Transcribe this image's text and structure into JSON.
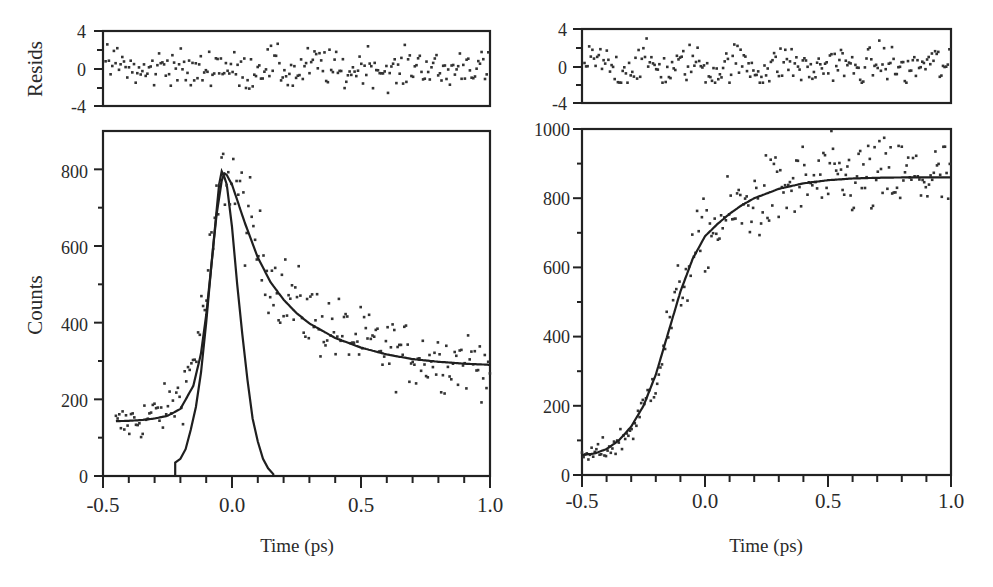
{
  "chart_data": [
    {
      "id": "left",
      "type": "scatter",
      "title": "",
      "panels": {
        "residuals": {
          "ylabel": "Resids",
          "ylim": [
            -4,
            4
          ],
          "yticks": [
            "4",
            "0",
            "-4"
          ],
          "ytick_values": [
            4,
            0,
            -4
          ],
          "minor_yticks": [
            2,
            -2
          ]
        },
        "main": {
          "ylabel": "Counts",
          "xlabel": "Time (ps)",
          "xlim": [
            -0.5,
            1.0
          ],
          "ylim": [
            0,
            900
          ],
          "xticks": [
            "-0.5",
            "0.0",
            "0.5",
            "1.0"
          ],
          "xtick_values": [
            -0.5,
            0.0,
            0.5,
            1.0
          ],
          "yticks": [
            "0",
            "200",
            "400",
            "600",
            "800"
          ],
          "ytick_values": [
            0,
            200,
            400,
            600,
            800
          ],
          "minor_ytick_values": [
            100,
            300,
            500,
            700
          ],
          "grid": false,
          "legend": null
        }
      },
      "series": [
        {
          "name": "data (scatter points)",
          "style": "dots",
          "x": [
            -0.45,
            -0.4,
            -0.35,
            -0.3,
            -0.25,
            -0.2,
            -0.15,
            -0.1,
            -0.07,
            -0.05,
            -0.03,
            -0.02,
            0.0,
            0.02,
            0.05,
            0.1,
            0.15,
            0.2,
            0.25,
            0.3,
            0.35,
            0.4,
            0.45,
            0.5,
            0.6,
            0.7,
            0.8,
            0.9,
            1.0
          ],
          "y": [
            130,
            140,
            148,
            160,
            175,
            210,
            300,
            470,
            620,
            730,
            790,
            810,
            780,
            740,
            680,
            590,
            525,
            480,
            445,
            420,
            400,
            380,
            365,
            350,
            330,
            315,
            305,
            300,
            295
          ]
        },
        {
          "name": "fit",
          "style": "line",
          "x": [
            -0.45,
            -0.4,
            -0.35,
            -0.3,
            -0.25,
            -0.2,
            -0.15,
            -0.12,
            -0.1,
            -0.08,
            -0.06,
            -0.04,
            -0.03,
            -0.02,
            0.0,
            0.02,
            0.05,
            0.1,
            0.15,
            0.2,
            0.25,
            0.3,
            0.4,
            0.5,
            0.6,
            0.7,
            0.8,
            0.9,
            1.0
          ],
          "y": [
            143,
            144,
            146,
            150,
            157,
            175,
            235,
            320,
            420,
            550,
            680,
            770,
            790,
            785,
            760,
            720,
            660,
            570,
            505,
            460,
            425,
            398,
            360,
            335,
            317,
            305,
            298,
            293,
            290
          ]
        },
        {
          "name": "instrument response",
          "style": "stepped line",
          "x": [
            -0.5,
            -0.22,
            -0.22,
            -0.2,
            -0.18,
            -0.16,
            -0.14,
            -0.12,
            -0.1,
            -0.08,
            -0.06,
            -0.05,
            -0.04,
            -0.03,
            -0.02,
            0.0,
            0.02,
            0.04,
            0.06,
            0.08,
            0.1,
            0.12,
            0.14,
            0.16,
            0.16,
            0.5
          ],
          "y": [
            0,
            0,
            35,
            45,
            70,
            120,
            180,
            270,
            400,
            550,
            690,
            760,
            795,
            780,
            760,
            650,
            500,
            370,
            250,
            150,
            90,
            45,
            20,
            5,
            0,
            0
          ]
        }
      ],
      "residuals_series": {
        "name": "residuals",
        "range_observed": [
          -2.6,
          3.2
        ]
      }
    },
    {
      "id": "right",
      "type": "scatter",
      "title": "",
      "panels": {
        "residuals": {
          "ylabel": "",
          "ylim": [
            -4,
            4
          ],
          "yticks": [
            "4",
            "0",
            "-4"
          ],
          "ytick_values": [
            4,
            0,
            -4
          ],
          "minor_yticks": [
            2,
            -2
          ]
        },
        "main": {
          "ylabel": "",
          "xlabel": "Time (ps)",
          "xlim": [
            -0.5,
            1.0
          ],
          "ylim": [
            0,
            1000
          ],
          "xticks": [
            "-0.5",
            "0.0",
            "0.5",
            "1.0"
          ],
          "xtick_values": [
            -0.5,
            0.0,
            0.5,
            1.0
          ],
          "yticks": [
            "0",
            "200",
            "400",
            "600",
            "800",
            "1000"
          ],
          "ytick_values": [
            0,
            200,
            400,
            600,
            800,
            1000
          ],
          "minor_ytick_values": [
            100,
            300,
            500,
            700,
            900
          ],
          "grid": false,
          "legend": null
        }
      },
      "series": [
        {
          "name": "data (scatter points)",
          "style": "dots",
          "x": [
            -0.5,
            -0.45,
            -0.4,
            -0.35,
            -0.3,
            -0.25,
            -0.2,
            -0.15,
            -0.1,
            -0.05,
            0.0,
            0.05,
            0.1,
            0.15,
            0.2,
            0.3,
            0.4,
            0.5,
            0.6,
            0.7,
            0.8,
            0.9,
            1.0
          ],
          "y": [
            55,
            60,
            75,
            95,
            130,
            190,
            290,
            420,
            540,
            630,
            695,
            720,
            750,
            770,
            790,
            820,
            840,
            850,
            855,
            858,
            860,
            860,
            855
          ]
        },
        {
          "name": "fit",
          "style": "line",
          "x": [
            -0.5,
            -0.45,
            -0.4,
            -0.35,
            -0.3,
            -0.25,
            -0.2,
            -0.15,
            -0.1,
            -0.05,
            0.0,
            0.05,
            0.1,
            0.15,
            0.2,
            0.3,
            0.4,
            0.5,
            0.6,
            0.7,
            0.8,
            0.9,
            1.0
          ],
          "y": [
            58,
            62,
            75,
            100,
            140,
            200,
            290,
            410,
            530,
            625,
            690,
            725,
            755,
            780,
            800,
            827,
            843,
            852,
            857,
            859,
            860,
            860,
            860
          ]
        }
      ],
      "residuals_series": {
        "name": "residuals",
        "range_observed": [
          -1.8,
          3.0
        ]
      }
    }
  ],
  "labels": {
    "left_resid_ylabel": "Resids",
    "left_main_ylabel": "Counts",
    "left_xlabel": "Time (ps)",
    "right_xlabel": "Time (ps)",
    "left_resid_ticks": [
      "4",
      "0",
      "-4"
    ],
    "right_resid_ticks": [
      "4",
      "0",
      "-4"
    ],
    "left_main_yticks": [
      "0",
      "200",
      "400",
      "600",
      "800"
    ],
    "right_main_yticks": [
      "0",
      "200",
      "400",
      "600",
      "800",
      "1000"
    ],
    "xticks": [
      "-0.5",
      "0.0",
      "0.5",
      "1.0"
    ]
  }
}
